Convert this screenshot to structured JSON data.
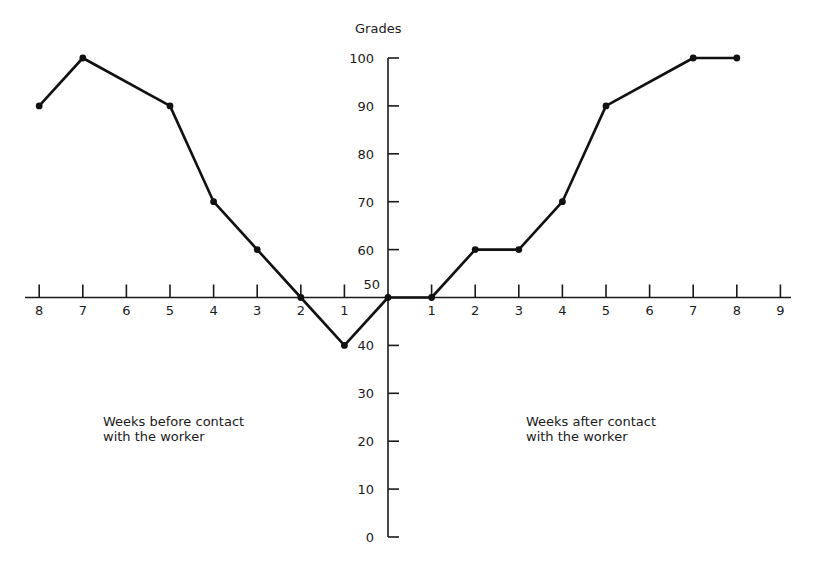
{
  "chart_data": {
    "type": "line",
    "title": "",
    "ylabel": "Grades",
    "xlabel": "",
    "ylim": [
      0,
      100
    ],
    "yticks": [
      0,
      10,
      20,
      30,
      40,
      50,
      60,
      70,
      80,
      90,
      100
    ],
    "x_tick_labels_before": [
      "8",
      "7",
      "6",
      "5",
      "4",
      "3",
      "2",
      "1"
    ],
    "x_tick_labels_after": [
      "1",
      "2",
      "3",
      "4",
      "5",
      "6",
      "7",
      "8",
      "9"
    ],
    "x_axis_crosses_y_at": 50,
    "grid": false,
    "annotations": [
      {
        "text": "Weeks before contact\nwith the worker",
        "position": "left-below-axis"
      },
      {
        "text": "Weeks after contact\nwith the worker",
        "position": "right-below-axis"
      }
    ],
    "series": [
      {
        "name": "Grades",
        "points": [
          {
            "x": -8,
            "y": 90
          },
          {
            "x": -7,
            "y": 100
          },
          {
            "x": -5,
            "y": 90
          },
          {
            "x": -4,
            "y": 70
          },
          {
            "x": -3,
            "y": 60
          },
          {
            "x": -2,
            "y": 50
          },
          {
            "x": -1,
            "y": 40
          },
          {
            "x": 0,
            "y": 50
          },
          {
            "x": 1,
            "y": 50
          },
          {
            "x": 2,
            "y": 60
          },
          {
            "x": 3,
            "y": 60
          },
          {
            "x": 4,
            "y": 70
          },
          {
            "x": 5,
            "y": 90
          },
          {
            "x": 7,
            "y": 100
          },
          {
            "x": 8,
            "y": 100
          }
        ]
      }
    ]
  },
  "labels": {
    "y_axis_title": "Grades",
    "before_note": "Weeks before contact\nwith the worker",
    "after_note": "Weeks after contact\nwith the worker"
  }
}
